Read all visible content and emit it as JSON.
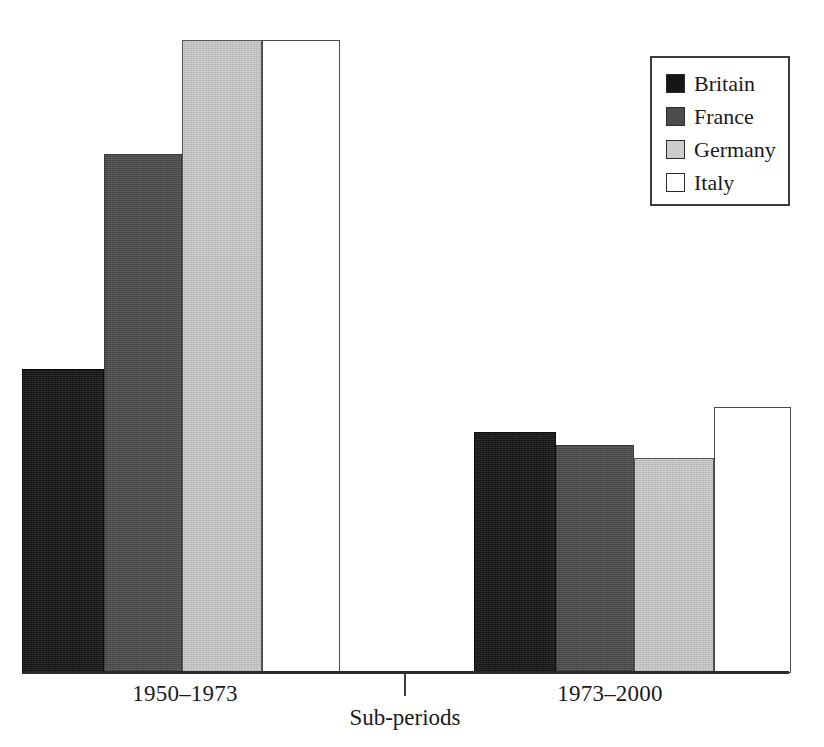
{
  "chart_data": {
    "type": "bar",
    "title": "",
    "subtitle": "",
    "xlabel": "Sub-periods",
    "ylabel": "",
    "categories": [
      "1950–1973",
      "1973–2000"
    ],
    "series": [
      {
        "name": "Britain",
        "color": "#161616",
        "values": [
          2.4,
          1.9
        ]
      },
      {
        "name": "France",
        "color": "#4c4c4c",
        "values": [
          4.1,
          1.8
        ]
      },
      {
        "name": "Germany",
        "color": "#cccccc",
        "values": [
          5.0,
          1.7
        ]
      },
      {
        "name": "Italy",
        "color": "#ffffff",
        "values": [
          5.0,
          2.1
        ]
      }
    ],
    "ylim": [
      0,
      5.15
    ],
    "grid": false,
    "y_axis_visible": false,
    "y_tick_labels": [],
    "legend_position": "top-right",
    "legend_entries": [
      "Britain",
      "France",
      "Germany",
      "Italy"
    ],
    "annotations": []
  },
  "axis": {
    "tick_labels": [
      "1950–1973",
      "1973–2000"
    ],
    "title": "Sub-periods"
  },
  "legend": {
    "items": [
      {
        "label": "Britain"
      },
      {
        "label": "France"
      },
      {
        "label": "Germany"
      },
      {
        "label": "Italy"
      }
    ]
  }
}
